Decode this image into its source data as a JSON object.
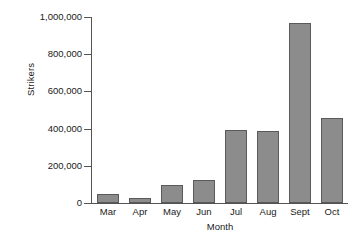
{
  "chart_data": {
    "type": "bar",
    "title": "",
    "xlabel": "Month",
    "ylabel": "Strikers",
    "categories": [
      "Mar",
      "Apr",
      "May",
      "Jun",
      "Jul",
      "Aug",
      "Sept",
      "Oct"
    ],
    "values": [
      50000,
      25000,
      97000,
      125000,
      390000,
      385000,
      970000,
      457000
    ],
    "ylim": [
      0,
      1000000
    ],
    "ytick_values": [
      0,
      200000,
      400000,
      600000,
      800000,
      1000000
    ],
    "ytick_labels": [
      "0",
      "200,000",
      "400,000",
      "600,000",
      "800,000",
      "1,000,000"
    ],
    "grid": false,
    "legend": null,
    "bar_color": "#8c8c8c",
    "bar_edge_color": "#5a5a5a",
    "axis_color": "#555555",
    "background_color": "#ffffff"
  }
}
